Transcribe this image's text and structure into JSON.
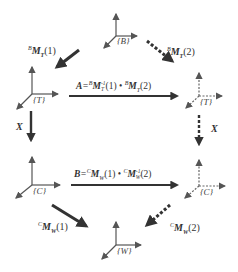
{
  "diagram": {
    "type": "coordinate-frame-transform-loop",
    "colors": {
      "arrow": "#333333",
      "axis": "#555555",
      "dotted_axis": "#666666"
    },
    "frames": [
      {
        "id": "B",
        "label": "{B}",
        "style": "solid"
      },
      {
        "id": "T1",
        "label": "{T}",
        "style": "solid"
      },
      {
        "id": "T2",
        "label": "{T}",
        "style": "dotted"
      },
      {
        "id": "C1",
        "label": "{C}",
        "style": "solid"
      },
      {
        "id": "C2",
        "label": "{C}",
        "style": "dotted"
      },
      {
        "id": "W",
        "label": "{W}",
        "style": "solid"
      }
    ],
    "transforms": {
      "bmt1": {
        "sup": "B",
        "base": "M",
        "sub": "T",
        "arg": "(1)"
      },
      "bmt2": {
        "sup": "B",
        "base": "M",
        "sub": "T",
        "arg": "(2)"
      },
      "cmw1": {
        "sup": "C",
        "base": "M",
        "sub": "W",
        "arg": "(1)"
      },
      "cmw2": {
        "sup": "C",
        "base": "M",
        "sub": "W",
        "arg": "(2)"
      },
      "x_left": "X",
      "x_right": "X"
    },
    "equations": {
      "A": {
        "lhs": "A",
        "eq": "=",
        "t1_sup": "B",
        "t1_base": "M",
        "t1_sub": "T",
        "t1_exp": "-1",
        "t1_arg": "(1)",
        "dot": "•",
        "t2_sup": "B",
        "t2_base": "M",
        "t2_sub": "T",
        "t2_arg": "(2)"
      },
      "B": {
        "lhs": "B",
        "eq": "=",
        "t1_sup": "C",
        "t1_base": "M",
        "t1_sub": "W",
        "t1_arg": "(1)",
        "dot": "•",
        "t2_sup": "C",
        "t2_base": "M",
        "t2_sub": "W",
        "t2_exp": "-1",
        "t2_arg": "(2)"
      }
    }
  }
}
